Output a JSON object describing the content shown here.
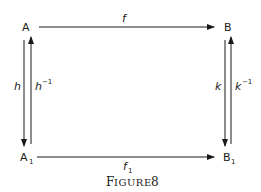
{
  "diagram": {
    "nodes": {
      "top_left": {
        "base": "A",
        "sub": ""
      },
      "top_right": {
        "base": "B",
        "sub": ""
      },
      "bottom_left": {
        "base": "A",
        "sub": "1"
      },
      "bottom_right": {
        "base": "B",
        "sub": "1"
      }
    },
    "arrows": {
      "top": {
        "label": "f",
        "sup": "",
        "sub": "",
        "from": "A",
        "to": "B"
      },
      "bottom": {
        "label": "f",
        "sub": "1",
        "from": "A1",
        "to": "B1"
      },
      "left_down": {
        "label": "h",
        "sup": "",
        "from": "A",
        "to": "A1"
      },
      "left_up": {
        "label": "h",
        "sup": "−1",
        "from": "A1",
        "to": "A"
      },
      "right_down": {
        "label": "k",
        "sup": "",
        "from": "B",
        "to": "B1"
      },
      "right_up": {
        "label": "k",
        "sup": "−1",
        "from": "B1",
        "to": "B"
      }
    },
    "caption": {
      "first": "F",
      "rest": "IGURE",
      "number": "8"
    }
  }
}
